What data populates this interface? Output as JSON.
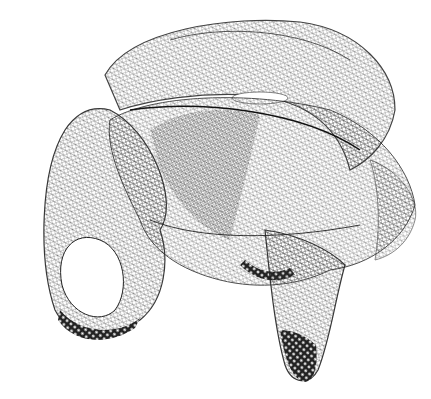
{
  "image": {
    "subject": "wireframe-3d-surface-mesh",
    "background": "#ffffff",
    "ink": "#1a1a1a",
    "width": 431,
    "height": 399
  }
}
